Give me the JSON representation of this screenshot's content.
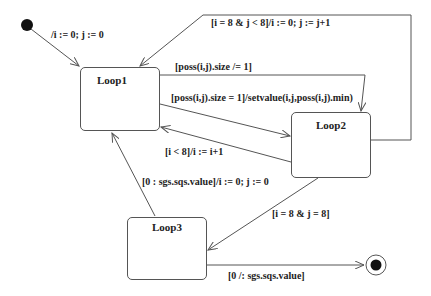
{
  "diagram": {
    "type": "state-machine",
    "states": [
      {
        "id": "loop1",
        "name": "Loop1"
      },
      {
        "id": "loop2",
        "name": "Loop2"
      },
      {
        "id": "loop3",
        "name": "Loop3"
      }
    ],
    "initial_state": {
      "name": "initial"
    },
    "final_state": {
      "name": "final"
    },
    "transitions": [
      {
        "id": "init_to_loop1",
        "from": "initial",
        "to": "loop1",
        "label": "/i := 0; j := 0"
      },
      {
        "id": "loop2_to_loop1_next_row",
        "from": "loop2",
        "to": "loop1",
        "label": "[i = 8 & j < 8]/i := 0; j := j+1"
      },
      {
        "id": "loop1_to_loop2_size_ne",
        "from": "loop1",
        "to": "loop2",
        "label": "[poss(i,j).size /= 1]"
      },
      {
        "id": "loop1_to_loop2_size_eq",
        "from": "loop1",
        "to": "loop2",
        "label": "[poss(i,j).size = 1]/setvalue(i,j,poss(i,j).min)"
      },
      {
        "id": "loop2_to_loop1_inc",
        "from": "loop2",
        "to": "loop1",
        "label": "[i < 8]/i := i+1"
      },
      {
        "id": "loop3_to_loop1",
        "from": "loop3",
        "to": "loop1",
        "label": "[0 : sgs.sqs.value]/i := 0; j := 0"
      },
      {
        "id": "loop2_to_loop3",
        "from": "loop2",
        "to": "loop3",
        "label": "[i = 8 & j = 8]"
      },
      {
        "id": "loop3_to_final",
        "from": "loop3",
        "to": "final",
        "label": "[0 /: sgs.sqs.value]"
      }
    ]
  },
  "colors": {
    "line": "#555555",
    "text": "#222222",
    "node_fill": "#111111"
  }
}
